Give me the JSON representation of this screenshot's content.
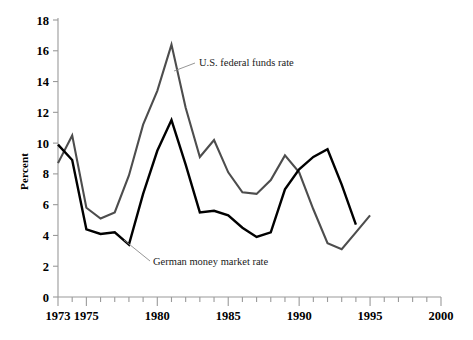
{
  "chart_data": {
    "type": "line",
    "title": "",
    "xlabel": "",
    "ylabel": "Percent",
    "xlim": [
      1973,
      2000
    ],
    "ylim": [
      0,
      18
    ],
    "yticks": [
      0,
      2,
      4,
      6,
      8,
      10,
      12,
      14,
      16,
      18
    ],
    "ytick_labels": [
      "0",
      "2",
      "4",
      "6",
      "8",
      "10",
      "12",
      "14",
      "16",
      "18"
    ],
    "xticks": [
      1973,
      1975,
      1980,
      1985,
      1990,
      1995,
      2000
    ],
    "xtick_labels": [
      "1973",
      "1975",
      "1980",
      "1985",
      "1990",
      "1995",
      "2000"
    ],
    "xtick_minor_step": 1,
    "grid": false,
    "legend": "annotations",
    "series": [
      {
        "name": "U.S. federal funds rate",
        "color": "#4d4d4d",
        "width": 2.1,
        "x": [
          1973,
          1974,
          1975,
          1976,
          1977,
          1978,
          1979,
          1980,
          1981,
          1982,
          1983,
          1984,
          1985,
          1986,
          1987,
          1988,
          1989,
          1990,
          1991,
          1992,
          1993,
          1994,
          1995
        ],
        "y": [
          8.7,
          10.5,
          5.8,
          5.1,
          5.5,
          7.9,
          11.2,
          13.4,
          16.4,
          12.3,
          9.1,
          10.2,
          8.1,
          6.8,
          6.7,
          7.6,
          9.2,
          8.1,
          5.7,
          3.5,
          3.1,
          4.2,
          5.3
        ]
      },
      {
        "name": "German money market rate",
        "color": "#000000",
        "width": 2.4,
        "x": [
          1973,
          1974,
          1975,
          1976,
          1977,
          1978,
          1979,
          1980,
          1981,
          1982,
          1983,
          1984,
          1985,
          1986,
          1987,
          1988,
          1989,
          1990,
          1991,
          1992,
          1993,
          1994
        ],
        "y": [
          9.9,
          8.9,
          4.4,
          4.1,
          4.2,
          3.4,
          6.7,
          9.5,
          11.5,
          8.6,
          5.5,
          5.6,
          5.3,
          4.5,
          3.9,
          4.2,
          7.0,
          8.3,
          9.1,
          9.6,
          7.3,
          4.7
        ]
      }
    ],
    "annotations": [
      {
        "text": "U.S. federal funds rate",
        "label_x": 199,
        "label_y": 66,
        "leader_from_x": 195,
        "leader_from_y": 63,
        "leader_to_x": 174,
        "leader_to_y": 71
      },
      {
        "text": "German money market rate",
        "label_x": 153,
        "label_y": 265,
        "leader_from_x": 150,
        "leader_from_y": 261,
        "leader_to_x": 124,
        "leader_to_y": 240
      }
    ]
  },
  "axis": {
    "y_label": "Percent"
  }
}
